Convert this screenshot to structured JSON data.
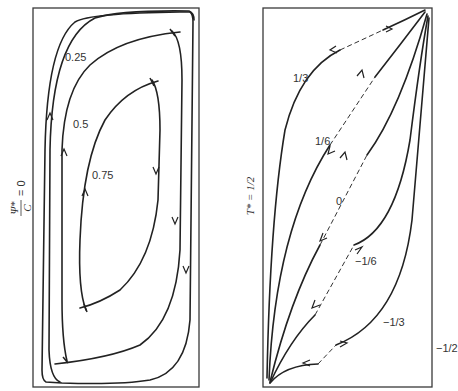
{
  "left_panel": {
    "side_label_numerator": "Ψ*",
    "side_label_denominator": "C",
    "side_label_rhs": "= 0",
    "contours": [
      {
        "label": "0.25"
      },
      {
        "label": "0.5"
      },
      {
        "label": "0.75"
      }
    ]
  },
  "right_panel": {
    "side_label": "T* = 1/2",
    "curves": [
      {
        "label": "1/3"
      },
      {
        "label": "1/6"
      },
      {
        "label": "0"
      },
      {
        "label": "−1/6"
      },
      {
        "label": "−1/3"
      },
      {
        "label": "−1/2"
      }
    ]
  }
}
